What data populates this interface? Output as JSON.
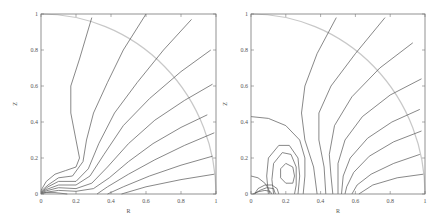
{
  "chart_data": [
    {
      "type": "line",
      "title": "",
      "xlabel": "R",
      "ylabel": "Z",
      "xlim": [
        0,
        1
      ],
      "ylim": [
        0,
        1
      ],
      "xticks": [
        "0",
        "0.2",
        "0.4",
        "0.6",
        "0.8",
        "1"
      ],
      "yticks": [
        "0",
        "0.2",
        "0.4",
        "0.6",
        "0.8",
        "1"
      ],
      "grid": false,
      "boundary_arc": {
        "radius": 1,
        "color": "#c8c8c8"
      },
      "series": [
        {
          "name": "c1",
          "points": [
            [
              0.29,
              0.98
            ],
            [
              0.22,
              0.75
            ],
            [
              0.17,
              0.6
            ],
            [
              0.17,
              0.45
            ],
            [
              0.2,
              0.3
            ],
            [
              0.22,
              0.2
            ],
            [
              0.2,
              0.15
            ],
            [
              0.14,
              0.13
            ],
            [
              0.08,
              0.11
            ],
            [
              0.03,
              0.07
            ],
            [
              0,
              0.02
            ]
          ]
        },
        {
          "name": "c2",
          "points": [
            [
              0.6,
              1.0
            ],
            [
              0.47,
              0.8
            ],
            [
              0.38,
              0.62
            ],
            [
              0.3,
              0.45
            ],
            [
              0.26,
              0.3
            ],
            [
              0.24,
              0.18
            ],
            [
              0.18,
              0.1
            ],
            [
              0.1,
              0.09
            ],
            [
              0.04,
              0.05
            ],
            [
              0,
              0.015
            ]
          ]
        },
        {
          "name": "c3",
          "points": [
            [
              0.86,
              0.97
            ],
            [
              0.7,
              0.8
            ],
            [
              0.55,
              0.62
            ],
            [
              0.42,
              0.45
            ],
            [
              0.33,
              0.28
            ],
            [
              0.27,
              0.14
            ],
            [
              0.2,
              0.07
            ],
            [
              0.1,
              0.07
            ],
            [
              0.04,
              0.04
            ],
            [
              0,
              0.01
            ]
          ]
        },
        {
          "name": "c4",
          "points": [
            [
              0.97,
              0.8
            ],
            [
              0.8,
              0.68
            ],
            [
              0.62,
              0.53
            ],
            [
              0.47,
              0.38
            ],
            [
              0.36,
              0.22
            ],
            [
              0.28,
              0.1
            ],
            [
              0.2,
              0.05
            ],
            [
              0.1,
              0.05
            ],
            [
              0.03,
              0.025
            ],
            [
              0,
              0.008
            ]
          ]
        },
        {
          "name": "c5",
          "points": [
            [
              0.98,
              0.61
            ],
            [
              0.82,
              0.52
            ],
            [
              0.65,
              0.41
            ],
            [
              0.5,
              0.28
            ],
            [
              0.38,
              0.15
            ],
            [
              0.29,
              0.06
            ],
            [
              0.2,
              0.03
            ],
            [
              0.1,
              0.035
            ],
            [
              0.03,
              0.018
            ],
            [
              0,
              0.005
            ]
          ]
        },
        {
          "name": "c6",
          "points": [
            [
              0.95,
              0.44
            ],
            [
              0.8,
              0.37
            ],
            [
              0.64,
              0.28
            ],
            [
              0.5,
              0.18
            ],
            [
              0.39,
              0.09
            ],
            [
              0.3,
              0.03
            ],
            [
              0.2,
              0.015
            ],
            [
              0.1,
              0.02
            ],
            [
              0.03,
              0.01
            ],
            [
              0,
              0.003
            ]
          ]
        },
        {
          "name": "c7",
          "points": [
            [
              0.99,
              0.34
            ],
            [
              0.82,
              0.27
            ],
            [
              0.65,
              0.19
            ],
            [
              0.5,
              0.11
            ],
            [
              0.38,
              0.04
            ],
            [
              0.32,
              0.0
            ]
          ]
        },
        {
          "name": "c8",
          "points": [
            [
              0.98,
              0.21
            ],
            [
              0.8,
              0.16
            ],
            [
              0.62,
              0.1
            ],
            [
              0.47,
              0.04
            ],
            [
              0.38,
              0.0
            ]
          ]
        },
        {
          "name": "c9",
          "points": [
            [
              0.99,
              0.11
            ],
            [
              0.8,
              0.08
            ],
            [
              0.6,
              0.04
            ],
            [
              0.46,
              0.0
            ]
          ]
        },
        {
          "name": "c10",
          "points": [
            [
              0.15,
              0.0
            ],
            [
              0.08,
              0.008
            ],
            [
              0.03,
              0.008
            ],
            [
              0,
              0.002
            ]
          ]
        }
      ]
    },
    {
      "type": "line",
      "title": "",
      "xlabel": "R",
      "ylabel": "Z",
      "xlim": [
        0,
        1
      ],
      "ylim": [
        0,
        1
      ],
      "xticks": [
        "0",
        "0.2",
        "0.4",
        "0.6",
        "0.8",
        "1"
      ],
      "yticks": [
        "0",
        "0.2",
        "0.4",
        "0.6",
        "0.8",
        "1"
      ],
      "grid": false,
      "boundary_arc": {
        "radius": 1,
        "color": "#c8c8c8"
      },
      "series": [
        {
          "name": "c1",
          "points": [
            [
              0.49,
              0.98
            ],
            [
              0.38,
              0.78
            ],
            [
              0.31,
              0.6
            ],
            [
              0.29,
              0.45
            ],
            [
              0.31,
              0.3
            ],
            [
              0.36,
              0.15
            ],
            [
              0.38,
              0.0
            ]
          ]
        },
        {
          "name": "c2",
          "points": [
            [
              0.77,
              0.98
            ],
            [
              0.6,
              0.78
            ],
            [
              0.46,
              0.6
            ],
            [
              0.39,
              0.45
            ],
            [
              0.39,
              0.3
            ],
            [
              0.42,
              0.15
            ],
            [
              0.43,
              0.0
            ]
          ]
        },
        {
          "name": "c3",
          "points": [
            [
              0.93,
              0.84
            ],
            [
              0.74,
              0.7
            ],
            [
              0.58,
              0.54
            ],
            [
              0.48,
              0.38
            ],
            [
              0.45,
              0.22
            ],
            [
              0.46,
              0.1
            ],
            [
              0.47,
              0.0
            ]
          ]
        },
        {
          "name": "c4",
          "points": [
            [
              0.98,
              0.64
            ],
            [
              0.8,
              0.55
            ],
            [
              0.64,
              0.43
            ],
            [
              0.54,
              0.3
            ],
            [
              0.5,
              0.17
            ],
            [
              0.5,
              0.05
            ],
            [
              0.5,
              0.0
            ]
          ]
        },
        {
          "name": "c5",
          "points": [
            [
              0.97,
              0.47
            ],
            [
              0.81,
              0.4
            ],
            [
              0.67,
              0.31
            ],
            [
              0.57,
              0.2
            ],
            [
              0.53,
              0.1
            ],
            [
              0.52,
              0.0
            ]
          ]
        },
        {
          "name": "c6",
          "points": [
            [
              0.98,
              0.35
            ],
            [
              0.82,
              0.29
            ],
            [
              0.68,
              0.21
            ],
            [
              0.59,
              0.12
            ],
            [
              0.55,
              0.04
            ],
            [
              0.54,
              0.0
            ]
          ]
        },
        {
          "name": "c7",
          "points": [
            [
              0.97,
              0.22
            ],
            [
              0.82,
              0.17
            ],
            [
              0.69,
              0.11
            ],
            [
              0.61,
              0.05
            ],
            [
              0.58,
              0.0
            ]
          ]
        },
        {
          "name": "c8",
          "points": [
            [
              0.99,
              0.11
            ],
            [
              0.84,
              0.09
            ],
            [
              0.7,
              0.05
            ],
            [
              0.62,
              0.0
            ]
          ]
        },
        {
          "name": "loop1",
          "points": [
            [
              0,
              0.43
            ],
            [
              0.1,
              0.42
            ],
            [
              0.2,
              0.38
            ],
            [
              0.28,
              0.3
            ],
            [
              0.31,
              0.2
            ],
            [
              0.31,
              0.1
            ],
            [
              0.3,
              0.0
            ]
          ]
        },
        {
          "name": "loop2",
          "points": [
            [
              0.1,
              0.0
            ],
            [
              0.09,
              0.1
            ],
            [
              0.1,
              0.2
            ],
            [
              0.16,
              0.27
            ],
            [
              0.22,
              0.27
            ],
            [
              0.27,
              0.2
            ],
            [
              0.28,
              0.1
            ],
            [
              0.27,
              0.0
            ]
          ]
        },
        {
          "name": "loop3",
          "points": [
            [
              0.13,
              0.0
            ],
            [
              0.12,
              0.08
            ],
            [
              0.13,
              0.17
            ],
            [
              0.18,
              0.23
            ],
            [
              0.23,
              0.22
            ],
            [
              0.26,
              0.15
            ],
            [
              0.26,
              0.05
            ],
            [
              0.25,
              0.0
            ]
          ]
        },
        {
          "name": "loop4",
          "points": [
            [
              0.2,
              0.06
            ],
            [
              0.17,
              0.09
            ],
            [
              0.17,
              0.14
            ],
            [
              0.2,
              0.17
            ],
            [
              0.24,
              0.15
            ],
            [
              0.25,
              0.1
            ],
            [
              0.24,
              0.06
            ],
            [
              0.2,
              0.06
            ]
          ]
        },
        {
          "name": "near0a",
          "points": [
            [
              0,
              0.1
            ],
            [
              0.04,
              0.09
            ],
            [
              0.08,
              0.06
            ],
            [
              0.1,
              0.03
            ],
            [
              0.11,
              0.0
            ]
          ]
        },
        {
          "name": "near0b",
          "points": [
            [
              0.02,
              0.0
            ],
            [
              0.04,
              0.03
            ],
            [
              0.08,
              0.05
            ],
            [
              0.12,
              0.05
            ],
            [
              0.15,
              0.03
            ],
            [
              0.16,
              0.0
            ]
          ]
        },
        {
          "name": "near0c",
          "points": [
            [
              0.02,
              0.0
            ],
            [
              0.05,
              0.02
            ],
            [
              0.09,
              0.035
            ],
            [
              0.13,
              0.03
            ],
            [
              0.14,
              0.0
            ]
          ]
        },
        {
          "name": "near0d",
          "points": [
            [
              0.01,
              0.0
            ],
            [
              0.04,
              0.012
            ],
            [
              0.08,
              0.02
            ],
            [
              0.11,
              0.015
            ],
            [
              0.12,
              0.0
            ]
          ]
        }
      ]
    }
  ]
}
